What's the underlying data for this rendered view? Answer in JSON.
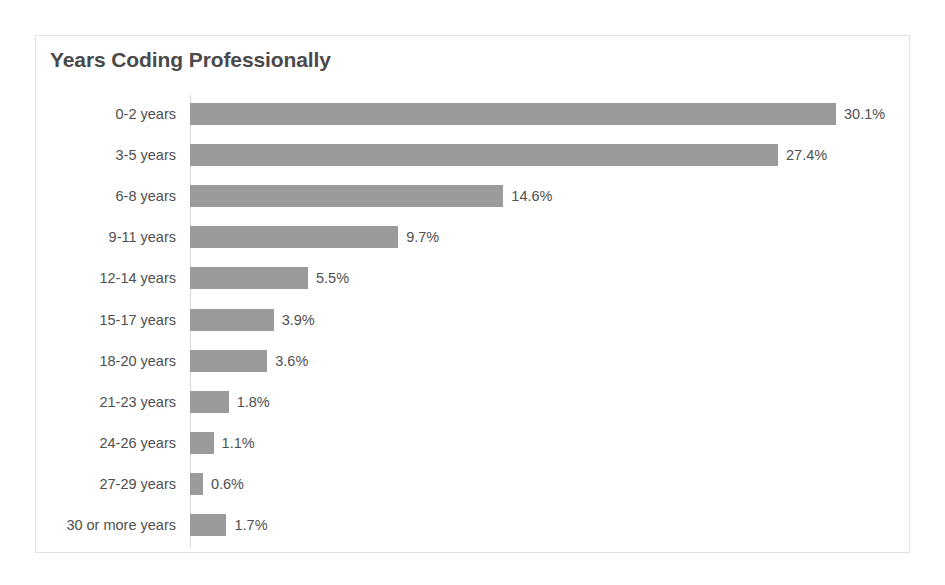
{
  "chart_data": {
    "type": "bar",
    "orientation": "horizontal",
    "title": "Years Coding Professionally",
    "xlabel": "",
    "ylabel": "",
    "xlim": [
      0,
      30.1
    ],
    "grid": false,
    "legend": null,
    "value_suffix": "%",
    "categories": [
      "0-2 years",
      "3-5 years",
      "6-8 years",
      "9-11 years",
      "12-14 years",
      "15-17 years",
      "18-20 years",
      "21-23 years",
      "24-26 years",
      "27-29 years",
      "30 or more years"
    ],
    "values": [
      30.1,
      27.4,
      14.6,
      9.7,
      5.5,
      3.9,
      3.6,
      1.8,
      1.1,
      0.6,
      1.7
    ],
    "data_labels": [
      "30.1%",
      "27.4%",
      "14.6%",
      "9.7%",
      "5.5%",
      "3.9%",
      "3.6%",
      "1.8%",
      "1.1%",
      "0.6%",
      "1.7%"
    ]
  },
  "style": {
    "bar_color": "#9a9a9a",
    "text_color": "#4f4f4f",
    "title_color": "#4a4a4a",
    "border_color": "#e2e2e2",
    "axis_color": "#d6d6d6",
    "background": "#ffffff"
  }
}
